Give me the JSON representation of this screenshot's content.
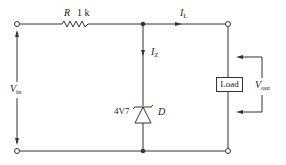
{
  "diagram": {
    "type": "zener-voltage-regulator-circuit",
    "colors": {
      "line": "#333333",
      "background": "#ffffff"
    },
    "labels": {
      "resistor": "R",
      "resistor_value": "1 k",
      "load_current": "I",
      "load_current_sub": "L",
      "zener_current": "I",
      "zener_current_sub": "Z",
      "zener_rating": "4V7",
      "zener_name": "D",
      "load": "Load",
      "input_voltage": "V",
      "input_voltage_sub": "in",
      "output_voltage": "V",
      "output_voltage_sub": "out"
    }
  }
}
